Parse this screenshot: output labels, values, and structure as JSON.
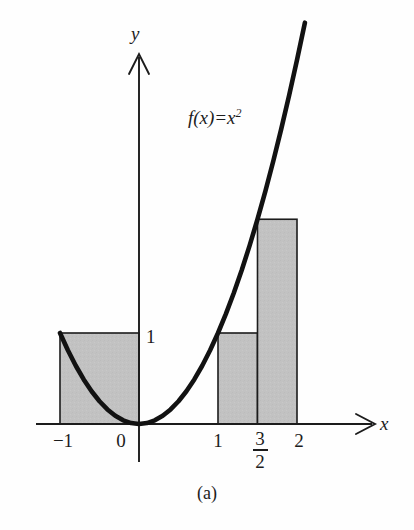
{
  "figure": {
    "caption": "(a)",
    "background_color": "#fefefe",
    "ink_color": "#1c1c1c",
    "fill_color": "#c2c2c2",
    "curve_label": {
      "function_name": "f(x)",
      "equals": "=",
      "base": "x",
      "exponent": "2",
      "full_text": "f(x) = x²"
    },
    "axes": {
      "x_axis_label": "x",
      "y_axis_label": "y",
      "x_ticks": [
        "−1",
        "0",
        "1",
        "2"
      ],
      "y_ticks": [
        "1"
      ],
      "fraction_tick": {
        "numerator": "3",
        "denominator": "2",
        "value": "3/2"
      }
    }
  },
  "chart_data": {
    "type": "area",
    "title": "",
    "subtitle": "",
    "xlabel": "x",
    "ylabel": "y",
    "xlim": [
      -1.55,
      2.95
    ],
    "ylim": [
      -0.45,
      4.25
    ],
    "grid": false,
    "legend": null,
    "annotations": [
      {
        "text": "f(x) = x²",
        "x": 0.62,
        "y": 3.6
      },
      {
        "text": "(a)",
        "x": 0.35,
        "y": -0.72
      }
    ],
    "series": [
      {
        "name": "f(x) = x^2",
        "type": "line",
        "expression": "x^2",
        "x_range": [
          -1,
          2.1
        ],
        "x": [
          -1.0,
          -0.9,
          -0.8,
          -0.7,
          -0.6,
          -0.5,
          -0.4,
          -0.3,
          -0.2,
          -0.1,
          0.0,
          0.1,
          0.2,
          0.3,
          0.4,
          0.5,
          0.6,
          0.7,
          0.8,
          0.9,
          1.0,
          1.1,
          1.2,
          1.3,
          1.4,
          1.5,
          1.6,
          1.7,
          1.8,
          1.9,
          2.0,
          2.1
        ],
        "y": [
          1.0,
          0.81,
          0.64,
          0.49,
          0.36,
          0.25,
          0.16,
          0.09,
          0.04,
          0.01,
          0.0,
          0.01,
          0.04,
          0.09,
          0.16,
          0.25,
          0.36,
          0.49,
          0.64,
          0.81,
          1.0,
          1.21,
          1.44,
          1.69,
          1.96,
          2.25,
          2.56,
          2.89,
          3.24,
          3.61,
          4.0,
          4.41
        ]
      },
      {
        "name": "Riemann rectangles",
        "type": "bar",
        "rectangles": [
          {
            "x_left": -1,
            "x_right": 0,
            "height": 1,
            "width": 1,
            "label": "[-1, 0]"
          },
          {
            "x_left": 1,
            "x_right": 1.5,
            "height": 1,
            "width": 0.5,
            "label": "[1, 3/2]"
          },
          {
            "x_left": 1.5,
            "x_right": 2,
            "height": 2.25,
            "width": 0.5,
            "label": "[3/2, 2]"
          }
        ]
      }
    ],
    "x_tick_values": [
      -1,
      0,
      1,
      1.5,
      2
    ],
    "x_tick_labels": [
      "−1",
      "0",
      "1",
      "3/2",
      "2"
    ],
    "y_tick_values": [
      1
    ],
    "y_tick_labels": [
      "1"
    ]
  }
}
